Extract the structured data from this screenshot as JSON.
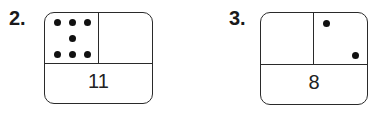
{
  "problems": [
    {
      "number": "2.",
      "left_part": {
        "dots": 7,
        "label": ""
      },
      "right_part": {
        "dots": 0,
        "label": ""
      },
      "total": "11"
    },
    {
      "number": "3.",
      "left_part": {
        "dots": 0,
        "label": ""
      },
      "right_part": {
        "dots": 2,
        "label": ""
      },
      "total": "8"
    }
  ]
}
